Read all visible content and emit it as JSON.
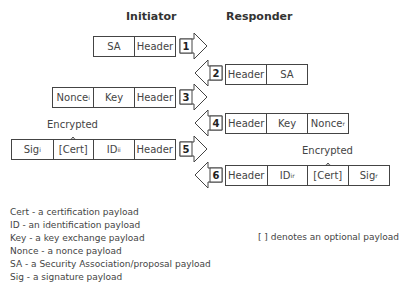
{
  "headers": {
    "initiator": "Initiator",
    "responder": "Responder"
  },
  "messages": [
    {
      "number": "1",
      "direction": "right",
      "cells": [
        {
          "label": "SA",
          "sub": ""
        },
        {
          "label": "Header",
          "sub": ""
        }
      ]
    },
    {
      "number": "2",
      "direction": "left",
      "cells": [
        {
          "label": "Header",
          "sub": ""
        },
        {
          "label": "SA",
          "sub": ""
        }
      ]
    },
    {
      "number": "3",
      "direction": "right",
      "cells": [
        {
          "label": "Nonce",
          "sub": "i"
        },
        {
          "label": "Key",
          "sub": ""
        },
        {
          "label": "Header",
          "sub": ""
        }
      ]
    },
    {
      "number": "4",
      "direction": "left",
      "cells": [
        {
          "label": "Header",
          "sub": ""
        },
        {
          "label": "Key",
          "sub": ""
        },
        {
          "label": "Nonce",
          "sub": "r"
        }
      ]
    },
    {
      "number": "5",
      "direction": "right",
      "encrypted_label": "Encrypted",
      "cells": [
        {
          "label": "Sig",
          "sub": "i"
        },
        {
          "label": "[Cert]",
          "sub": ""
        },
        {
          "label": "ID",
          "sub": "ii"
        },
        {
          "label": "Header",
          "sub": ""
        }
      ]
    },
    {
      "number": "6",
      "direction": "left",
      "encrypted_label": "Encrypted",
      "cells": [
        {
          "label": "Header",
          "sub": ""
        },
        {
          "label": "ID",
          "sub": "ir"
        },
        {
          "label": "[Cert]",
          "sub": ""
        },
        {
          "label": "Sig",
          "sub": "r"
        }
      ]
    }
  ],
  "legend": [
    "Cert - a certification payload",
    "ID - an identification payload",
    "Key - a key exchange payload",
    "Nonce - a nonce payload",
    "SA - a Security Association/proposal payload",
    "Sig - a signature payload"
  ],
  "note": "[ ] denotes an optional payload"
}
